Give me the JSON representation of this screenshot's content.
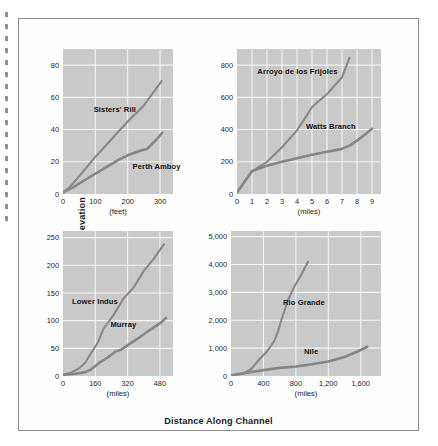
{
  "figure": {
    "ylabel": "Elevation Above Mouth (feet)",
    "xlabel": "Distance Along Channel"
  },
  "chart_data": [
    {
      "id": "panel-top-left",
      "type": "line",
      "title": "",
      "xlabel": "(feet)",
      "ylabel": "",
      "xunit": "feet",
      "yunit": "feet",
      "xlim": [
        0,
        340
      ],
      "ylim": [
        0,
        90
      ],
      "xticks": [
        0,
        100,
        200,
        300
      ],
      "xticklabels": [
        "0",
        "100",
        "200",
        "300"
      ],
      "yticks": [
        0,
        20,
        40,
        60,
        80
      ],
      "yticklabels": [
        "0",
        "20",
        "40",
        "60",
        "80"
      ],
      "grid": true,
      "legend": "inline-annotations",
      "series": [
        {
          "name": "Sisters' Rill",
          "label_x": 95,
          "label_y": 52,
          "points": [
            [
              0,
              1
            ],
            [
              20,
              4
            ],
            [
              50,
              11
            ],
            [
              100,
              23
            ],
            [
              150,
              34
            ],
            [
              200,
              45
            ],
            [
              250,
              55
            ],
            [
              290,
              66
            ],
            [
              305,
              70
            ]
          ]
        },
        {
          "name": "Perth Amboy",
          "label_x": 215,
          "label_y": 17,
          "points": [
            [
              0,
              1
            ],
            [
              30,
              4
            ],
            [
              70,
              9
            ],
            [
              120,
              15
            ],
            [
              170,
              21
            ],
            [
              200,
              24
            ],
            [
              240,
              27
            ],
            [
              260,
              28
            ],
            [
              290,
              34
            ],
            [
              307,
              38
            ]
          ]
        }
      ]
    },
    {
      "id": "panel-top-right",
      "type": "line",
      "title": "",
      "xlabel": "(miles)",
      "ylabel": "",
      "xunit": "miles",
      "yunit": "feet",
      "xlim": [
        0,
        9.6
      ],
      "ylim": [
        0,
        900
      ],
      "xticks": [
        0,
        1,
        2,
        3,
        4,
        5,
        6,
        7,
        8,
        9
      ],
      "xticklabels": [
        "0",
        "1",
        "2",
        "3",
        "4",
        "5",
        "6",
        "7",
        "8",
        "9"
      ],
      "yticks": [
        0,
        200,
        400,
        600,
        800
      ],
      "yticklabels": [
        "0",
        "200",
        "400",
        "600",
        "800"
      ],
      "grid": true,
      "legend": "inline-annotations",
      "series": [
        {
          "name": "Arroyo de los Frijoles",
          "label_x": 1.35,
          "label_y": 760,
          "points": [
            [
              0,
              10
            ],
            [
              1,
              140
            ],
            [
              2,
              200
            ],
            [
              3,
              290
            ],
            [
              4,
              395
            ],
            [
              4.6,
              480
            ],
            [
              5,
              540
            ],
            [
              6,
              620
            ],
            [
              7,
              725
            ],
            [
              7.5,
              845
            ]
          ]
        },
        {
          "name": "Watts Branch",
          "label_x": 4.6,
          "label_y": 415,
          "points": [
            [
              0,
              10
            ],
            [
              1,
              142
            ],
            [
              2,
              175
            ],
            [
              3,
              200
            ],
            [
              4,
              222
            ],
            [
              5,
              243
            ],
            [
              6,
              262
            ],
            [
              7,
              280
            ],
            [
              7.6,
              305
            ],
            [
              8.2,
              345
            ],
            [
              9,
              405
            ]
          ]
        }
      ]
    },
    {
      "id": "panel-bottom-left",
      "type": "line",
      "title": "",
      "xlabel": "(miles)",
      "ylabel": "",
      "xunit": "miles",
      "yunit": "feet",
      "xlim": [
        0,
        545
      ],
      "ylim": [
        0,
        262
      ],
      "xticks": [
        0,
        160,
        320,
        480
      ],
      "xticklabels": [
        "0",
        "160",
        "320",
        "480"
      ],
      "yticks": [
        0,
        50,
        100,
        150,
        200,
        250
      ],
      "yticklabels": [
        "0",
        "50",
        "100",
        "150",
        "200",
        "250"
      ],
      "grid": true,
      "legend": "inline-annotations",
      "series": [
        {
          "name": "Lower Indus",
          "label_x": 45,
          "label_y": 133,
          "points": [
            [
              0,
              2
            ],
            [
              40,
              6
            ],
            [
              80,
              14
            ],
            [
              110,
              24
            ],
            [
              140,
              42
            ],
            [
              175,
              62
            ],
            [
              200,
              85
            ],
            [
              250,
              110
            ],
            [
              300,
              140
            ],
            [
              350,
              160
            ],
            [
              400,
              190
            ],
            [
              450,
              212
            ],
            [
              500,
              238
            ]
          ]
        },
        {
          "name": "Murray",
          "label_x": 235,
          "label_y": 92,
          "points": [
            [
              0,
              2
            ],
            [
              60,
              4
            ],
            [
              110,
              7
            ],
            [
              140,
              12
            ],
            [
              180,
              24
            ],
            [
              220,
              33
            ],
            [
              260,
              44
            ],
            [
              290,
              48
            ],
            [
              330,
              58
            ],
            [
              380,
              70
            ],
            [
              430,
              83
            ],
            [
              480,
              95
            ],
            [
              510,
              105
            ]
          ]
        }
      ]
    },
    {
      "id": "panel-bottom-right",
      "type": "line",
      "title": "",
      "xlabel": "(miles)",
      "ylabel": "",
      "xunit": "miles",
      "yunit": "feet",
      "xlim": [
        0,
        1850
      ],
      "ylim": [
        0,
        5200
      ],
      "xticks": [
        0,
        400,
        800,
        1200,
        1600
      ],
      "xticklabels": [
        "0",
        "400",
        "800",
        "1,200",
        "1,600"
      ],
      "yticks": [
        0,
        1000,
        2000,
        3000,
        4000,
        5000
      ],
      "yticklabels": [
        "0",
        "1,000",
        "2,000",
        "3,000",
        "4,000",
        "5,000"
      ],
      "grid": true,
      "legend": "inline-annotations",
      "series": [
        {
          "name": "Rio Grande",
          "label_x": 640,
          "label_y": 2620,
          "points": [
            [
              0,
              20
            ],
            [
              150,
              80
            ],
            [
              250,
              250
            ],
            [
              350,
              600
            ],
            [
              450,
              900
            ],
            [
              500,
              1120
            ],
            [
              530,
              1230
            ],
            [
              580,
              1600
            ],
            [
              620,
              2000
            ],
            [
              700,
              2700
            ],
            [
              780,
              3200
            ],
            [
              870,
              3650
            ],
            [
              950,
              4100
            ]
          ]
        },
        {
          "name": "Nile",
          "label_x": 900,
          "label_y": 860,
          "points": [
            [
              0,
              20
            ],
            [
              200,
              120
            ],
            [
              400,
              210
            ],
            [
              600,
              290
            ],
            [
              800,
              340
            ],
            [
              1000,
              420
            ],
            [
              1200,
              520
            ],
            [
              1400,
              680
            ],
            [
              1560,
              880
            ],
            [
              1680,
              1050
            ]
          ]
        }
      ]
    }
  ]
}
